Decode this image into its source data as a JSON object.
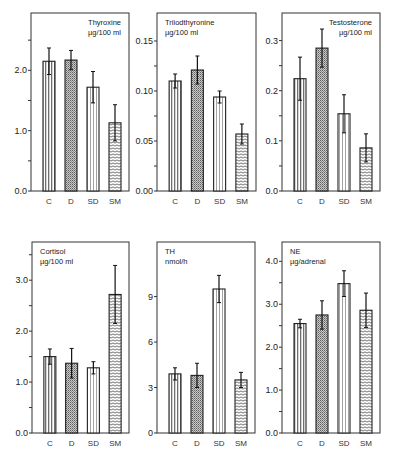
{
  "chart_data": [
    {
      "type": "bar",
      "title": "Thyroxine",
      "unit": "µg/100 ml",
      "title_align": "right",
      "categories": [
        "C",
        "D",
        "SD",
        "SM"
      ],
      "values": [
        2.15,
        2.17,
        1.72,
        1.13
      ],
      "errors": [
        0.22,
        0.16,
        0.26,
        0.3
      ],
      "ylim": [
        0,
        2.95
      ],
      "yticks": [
        0,
        0.5,
        1.0,
        1.5,
        2.0,
        2.5
      ],
      "yticklabels": [
        "0.0",
        "",
        "1.0",
        "",
        "2.0",
        ""
      ]
    },
    {
      "type": "bar",
      "title": "Triiodthyronine",
      "unit": "µg/100 ml",
      "title_align": "left",
      "categories": [
        "C",
        "D",
        "SD",
        "SM"
      ],
      "values": [
        0.11,
        0.121,
        0.094,
        0.057
      ],
      "errors": [
        0.007,
        0.014,
        0.006,
        0.01
      ],
      "ylim": [
        0,
        0.178
      ],
      "yticks": [
        0,
        0.025,
        0.05,
        0.075,
        0.1,
        0.125,
        0.15
      ],
      "yticklabels": [
        "0.00",
        "",
        "0.05",
        "",
        "0.10",
        "",
        "0.15"
      ]
    },
    {
      "type": "bar",
      "title": "Testosterone",
      "unit": "µg/100 ml",
      "title_align": "right",
      "categories": [
        "C",
        "D",
        "SD",
        "SM"
      ],
      "values": [
        0.224,
        0.285,
        0.154,
        0.086
      ],
      "errors": [
        0.043,
        0.038,
        0.038,
        0.028
      ],
      "ylim": [
        0,
        0.355
      ],
      "yticks": [
        0,
        0.05,
        0.1,
        0.15,
        0.2,
        0.25,
        0.3
      ],
      "yticklabels": [
        "0.0",
        "",
        "0.1",
        "",
        "0.2",
        "",
        "0.3"
      ]
    },
    {
      "type": "bar",
      "title": "Cortisol",
      "unit": "µg/100 ml",
      "title_align": "left",
      "categories": [
        "C",
        "D",
        "SD",
        "SM"
      ],
      "values": [
        1.5,
        1.37,
        1.28,
        2.72
      ],
      "errors": [
        0.15,
        0.29,
        0.12,
        0.57
      ],
      "ylim": [
        0,
        3.75
      ],
      "yticks": [
        0,
        0.5,
        1.0,
        1.5,
        2.0,
        2.5,
        3.0,
        3.5
      ],
      "yticklabels": [
        "0.0",
        "",
        "1.0",
        "",
        "2.0",
        "",
        "3.0",
        ""
      ]
    },
    {
      "type": "bar",
      "title": "TH",
      "unit": "nmol/h",
      "title_align": "left",
      "categories": [
        "C",
        "D",
        "SD",
        "SM"
      ],
      "values": [
        3.9,
        3.8,
        9.5,
        3.5
      ],
      "errors": [
        0.4,
        0.8,
        0.9,
        0.5
      ],
      "ylim": [
        0,
        12.6
      ],
      "yticks": [
        0,
        3,
        6,
        9
      ],
      "yticklabels": [
        "0",
        "3",
        "6",
        "9"
      ]
    },
    {
      "type": "bar",
      "title": "NE",
      "unit": "µg/adrenal",
      "title_align": "left",
      "categories": [
        "C",
        "D",
        "SD",
        "SM"
      ],
      "values": [
        2.55,
        2.75,
        3.48,
        2.86
      ],
      "errors": [
        0.1,
        0.33,
        0.3,
        0.4
      ],
      "ylim": [
        0,
        4.45
      ],
      "yticks": [
        0,
        0.5,
        1.0,
        1.5,
        2.0,
        2.5,
        3.0,
        3.5,
        4.0
      ],
      "yticklabels": [
        "0.0",
        "",
        "1.0",
        "",
        "2.0",
        "",
        "3.0",
        "",
        "4.0"
      ]
    }
  ]
}
